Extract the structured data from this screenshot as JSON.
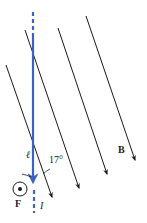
{
  "diagram": {
    "colors": {
      "field_lines": "#1a1a1a",
      "wire": "#3a63c4",
      "text": "#222222"
    },
    "labels": {
      "length": "ℓ",
      "angle": "17°",
      "field": "B",
      "force": "F",
      "current": "I"
    },
    "field_lines": [
      {
        "x1": 6,
        "y1": 65,
        "x2": 52,
        "y2": 197
      },
      {
        "x1": 25,
        "y1": 30,
        "x2": 79,
        "y2": 188
      },
      {
        "x1": 58,
        "y1": 28,
        "x2": 107,
        "y2": 174
      },
      {
        "x1": 86,
        "y1": 16,
        "x2": 135,
        "y2": 160
      }
    ],
    "wire": {
      "x": 33,
      "dashed_top": [
        12,
        36
      ],
      "solid": [
        36,
        183
      ],
      "dashed_bottom": [
        190,
        213
      ]
    },
    "force_symbol": {
      "type": "out-of-page",
      "cx": 20,
      "cy": 189,
      "r": 7
    }
  }
}
